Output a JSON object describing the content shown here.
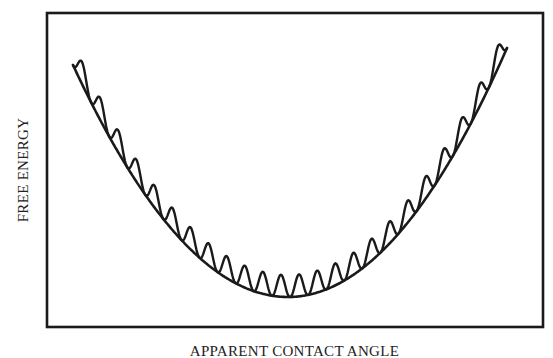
{
  "chart_data": {
    "type": "line",
    "title": "",
    "xlabel": "APPARENT CONTACT ANGLE",
    "ylabel": "FREE ENERGY",
    "grid": false,
    "legend": null,
    "axis_ticks": "none",
    "series": [
      {
        "name": "smooth-envelope",
        "description": "Smooth parabolic free-energy curve with a single global minimum",
        "shape": "parabola",
        "points_px": {
          "left": [
            73,
            65
          ],
          "min": [
            288,
            297
          ],
          "right": [
            507,
            48
          ]
        }
      },
      {
        "name": "metastable-states",
        "description": "Oscillating curve resting on the parabola, producing many local minima",
        "shape": "parabola-plus-periodic-bumps",
        "bump_count": 24,
        "bump_height_px": 22
      }
    ],
    "frame_px": {
      "left": 47,
      "top": 13,
      "right": 543,
      "bottom": 327
    }
  },
  "colors": {
    "stroke": "#1a1a1a",
    "background": "#ffffff"
  }
}
